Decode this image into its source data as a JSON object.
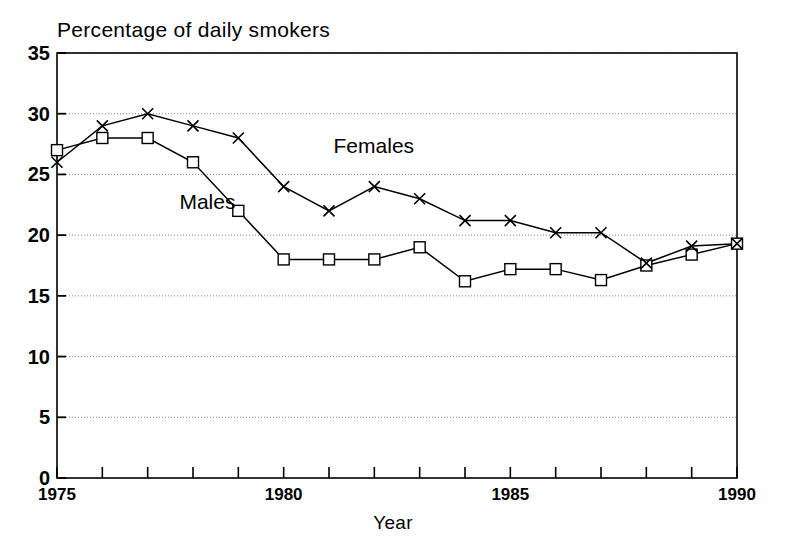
{
  "chart_data": {
    "type": "line",
    "title": "Percentage of daily smokers",
    "xlabel": "Year",
    "ylabel": "",
    "x": [
      1975,
      1976,
      1977,
      1978,
      1979,
      1980,
      1981,
      1982,
      1983,
      1984,
      1985,
      1986,
      1987,
      1988,
      1989,
      1990
    ],
    "xlim": [
      1975,
      1990
    ],
    "ylim": [
      0,
      35
    ],
    "xticks": [
      1975,
      1976,
      1977,
      1978,
      1979,
      1980,
      1981,
      1982,
      1983,
      1984,
      1985,
      1986,
      1987,
      1988,
      1989,
      1990
    ],
    "xtick_labels": [
      "1975",
      "",
      "",
      "",
      "",
      "1980",
      "",
      "",
      "",
      "",
      "1985",
      "",
      "",
      "",
      "",
      "1990"
    ],
    "yticks": [
      0,
      5,
      10,
      15,
      20,
      25,
      30,
      35
    ],
    "ytick_labels": [
      "0",
      "5",
      "10",
      "15",
      "20",
      "25",
      "30",
      "35"
    ],
    "grid": "horizontal-dotted",
    "legend": "inline-annotations",
    "series": [
      {
        "name": "Males",
        "marker": "square",
        "values": [
          27,
          28,
          28,
          26,
          22,
          18,
          18,
          18,
          19,
          16.2,
          17.2,
          17.2,
          16.3,
          17.5,
          18.4,
          19.3
        ]
      },
      {
        "name": "Females",
        "marker": "x",
        "values": [
          26,
          29,
          30,
          29,
          28,
          24,
          22,
          24,
          23,
          21.2,
          21.2,
          20.2,
          20.2,
          17.7,
          19.1,
          19.3
        ]
      }
    ],
    "annotations": [
      {
        "text": "Females",
        "x": 1981.1,
        "y": 27.2
      },
      {
        "text": "Males",
        "x": 1977.7,
        "y": 22.6
      }
    ],
    "colors": {
      "line": "#000000",
      "axis": "#000000",
      "grid": "#888888",
      "background": "#ffffff"
    }
  }
}
